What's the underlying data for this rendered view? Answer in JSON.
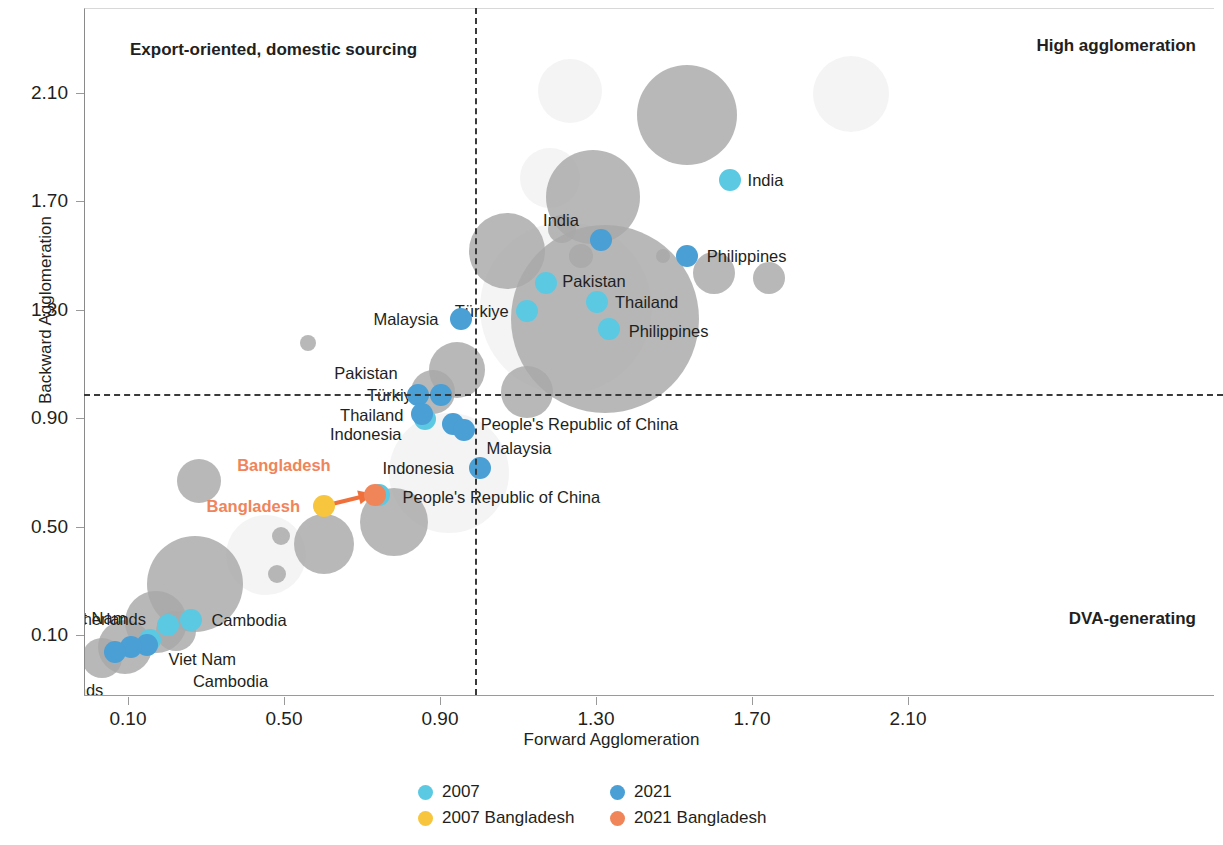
{
  "chart_data": {
    "type": "scatter",
    "title": "",
    "xlabel": "Forward Agglomeration",
    "ylabel": "Backward Agglomeration",
    "xticks": [
      "0.10",
      "0.50",
      "0.90",
      "1.30",
      "1.70",
      "2.10"
    ],
    "yticks": [
      "0.10",
      "0.50",
      "0.90",
      "1.30",
      "1.70",
      "2.10"
    ],
    "xlim": [
      -0.02,
      2.34
    ],
    "ylim": [
      -0.06,
      2.33
    ],
    "grid": false,
    "reference_lines": {
      "vertical_x": 0.99,
      "horizontal_y": 0.99,
      "style": "dashed"
    },
    "quadrant_labels": {
      "top_left": "Export-oriented, domestic sourcing",
      "top_right": "High agglomeration",
      "bottom_right": "DVA-generating"
    },
    "series": [
      {
        "name": "2007",
        "color": "#5cc9e3",
        "points": [
          {
            "label": "India",
            "x": 1.64,
            "y": 1.78,
            "label_side": "right"
          },
          {
            "label": "Pakistan",
            "x": 1.17,
            "y": 1.4,
            "label_side": "right"
          },
          {
            "label": "Thailand",
            "x": 1.3,
            "y": 1.33,
            "label_side": "right"
          },
          {
            "label": "Philippines",
            "x": 1.33,
            "y": 1.23,
            "label_side": "right"
          },
          {
            "label": "Türkiye",
            "x": 1.12,
            "y": 1.3,
            "label_side": "left"
          },
          {
            "label": "Thailand",
            "x": 0.86,
            "y": 0.9,
            "label_side": "left"
          },
          {
            "label": "People's Republic of China",
            "x": 0.74,
            "y": 0.62,
            "label_side": "right"
          },
          {
            "label": "Cambodia",
            "x": 0.26,
            "y": 0.16,
            "label_side": "right"
          },
          {
            "label": "Netherlands",
            "x": 0.2,
            "y": 0.14,
            "label_side": "left"
          },
          {
            "label": "Viet Nam",
            "x": 0.155,
            "y": 0.085,
            "label_side": "left"
          }
        ]
      },
      {
        "name": "2021",
        "color": "#4a9fd5",
        "points": [
          {
            "label": "India",
            "x": 1.31,
            "y": 1.56,
            "label_side": "left"
          },
          {
            "label": "Philippines",
            "x": 1.53,
            "y": 1.5,
            "label_side": "right"
          },
          {
            "label": "Malaysia",
            "x": 0.95,
            "y": 1.27,
            "label_side": "left"
          },
          {
            "label": "Türkiye",
            "x": 0.9,
            "y": 0.99,
            "label_side": "left"
          },
          {
            "label": "Pakistan",
            "x": 0.84,
            "y": 0.99,
            "label_side": "left"
          },
          {
            "label": "Indonesia",
            "x": 0.85,
            "y": 0.92,
            "label_side": "left"
          },
          {
            "label": "People's Republic of China",
            "x": 0.93,
            "y": 0.88,
            "label_side": "right"
          },
          {
            "label": "Malaysia",
            "x": 0.96,
            "y": 0.86,
            "label_side": "right"
          },
          {
            "label": "Indonesia",
            "x": 1.0,
            "y": 0.72,
            "label_side": "left"
          },
          {
            "label": "Viet Nam",
            "x": 0.145,
            "y": 0.065,
            "label_side": "right"
          },
          {
            "label": "Cambodia",
            "x": 0.105,
            "y": 0.06,
            "label_side": "right"
          },
          {
            "label": "Netherlands",
            "x": 0.065,
            "y": 0.04,
            "label_side": "left"
          }
        ]
      },
      {
        "name": "2007 Bangladesh",
        "color": "#f7c63e",
        "points": [
          {
            "label": "Bangladesh",
            "x": 0.6,
            "y": 0.58,
            "label_side": "left"
          }
        ]
      },
      {
        "name": "2021 Bangladesh",
        "color": "#f0855a",
        "points": [
          {
            "label": "Bangladesh",
            "x": 0.73,
            "y": 0.62,
            "label_side": "left"
          }
        ]
      }
    ],
    "background_bubbles": [
      {
        "x": 0.56,
        "y": 1.18,
        "r": 8
      },
      {
        "x": 1.07,
        "y": 1.52,
        "r": 38
      },
      {
        "x": 1.12,
        "y": 1.0,
        "r": 26
      },
      {
        "x": 1.29,
        "y": 1.72,
        "r": 47
      },
      {
        "x": 1.53,
        "y": 2.02,
        "r": 50
      },
      {
        "x": 1.21,
        "y": 1.6,
        "r": 14
      },
      {
        "x": 1.32,
        "y": 1.27,
        "r": 94
      },
      {
        "x": 1.26,
        "y": 1.5,
        "r": 12
      },
      {
        "x": 1.47,
        "y": 1.5,
        "r": 7
      },
      {
        "x": 1.6,
        "y": 1.44,
        "r": 21
      },
      {
        "x": 1.74,
        "y": 1.42,
        "r": 16
      },
      {
        "x": 0.94,
        "y": 1.08,
        "r": 28
      },
      {
        "x": 0.88,
        "y": 1.0,
        "r": 22
      },
      {
        "x": 0.78,
        "y": 0.52,
        "r": 34
      },
      {
        "x": 0.6,
        "y": 0.44,
        "r": 30
      },
      {
        "x": 0.49,
        "y": 0.47,
        "r": 9
      },
      {
        "x": 0.48,
        "y": 0.33,
        "r": 9
      },
      {
        "x": 0.28,
        "y": 0.67,
        "r": 22
      },
      {
        "x": 0.27,
        "y": 0.29,
        "r": 48
      },
      {
        "x": 0.17,
        "y": 0.15,
        "r": 31
      },
      {
        "x": 0.09,
        "y": 0.06,
        "r": 27
      },
      {
        "x": 0.03,
        "y": 0.02,
        "r": 20
      },
      {
        "x": 0.22,
        "y": 0.12,
        "r": 20
      }
    ],
    "background_halos": [
      {
        "x": 1.23,
        "y": 2.11,
        "r": 32
      },
      {
        "x": 1.95,
        "y": 2.1,
        "r": 38
      },
      {
        "x": 1.18,
        "y": 1.79,
        "r": 30
      },
      {
        "x": 1.22,
        "y": 1.31,
        "r": 86
      },
      {
        "x": 0.92,
        "y": 0.7,
        "r": 60
      },
      {
        "x": 0.45,
        "y": 0.4,
        "r": 40
      }
    ]
  },
  "legend": {
    "position": "bottom-center",
    "entries": [
      {
        "label": "2007",
        "color": "#5cc9e3"
      },
      {
        "label": "2021",
        "color": "#4a9fd5"
      },
      {
        "label": "2007 Bangladesh",
        "color": "#f7c63e"
      },
      {
        "label": "2021 Bangladesh",
        "color": "#f0855a"
      }
    ]
  },
  "annotation_arrow": {
    "from_label": "2007 Bangladesh",
    "to_label": "2021 Bangladesh",
    "color": "#f0703c"
  }
}
